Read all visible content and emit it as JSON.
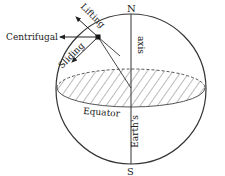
{
  "diagram": {
    "labels": {
      "north": "N",
      "south": "S",
      "axis": "axis",
      "earths": "Earth's",
      "equator": "Equator",
      "centrifugal": "Centrifugal",
      "lifting": "Lifting",
      "sliding": "Sliding"
    },
    "colors": {
      "stroke": "#222222",
      "hatch": "#555555",
      "background": "#ffffff"
    }
  }
}
